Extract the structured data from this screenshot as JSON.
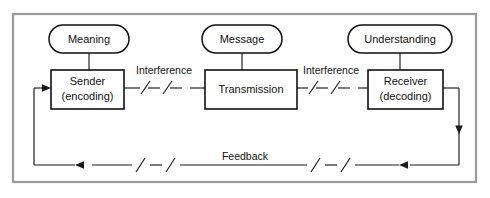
{
  "diagram": {
    "frame": {
      "border_color": "#9a9a9a",
      "background": "#ffffff"
    },
    "ink_color": "#111111",
    "stadium_nodes": [
      {
        "id": "meaning",
        "label": "Meaning",
        "cx": 89,
        "cy": 39,
        "w": 80,
        "h": 28
      },
      {
        "id": "message",
        "label": "Message",
        "cx": 242,
        "cy": 39,
        "w": 80,
        "h": 28
      },
      {
        "id": "understanding",
        "label": "Understanding",
        "cx": 400,
        "cy": 39,
        "w": 104,
        "h": 28
      }
    ],
    "box_nodes": [
      {
        "id": "sender",
        "line1": "Sender",
        "line2": "(encoding)",
        "x": 51,
        "y": 70,
        "w": 73,
        "h": 39
      },
      {
        "id": "transmission",
        "line1": "Transmission",
        "line2": "",
        "x": 205,
        "y": 70,
        "w": 92,
        "h": 39
      },
      {
        "id": "receiver",
        "line1": "Receiver",
        "line2": "(decoding)",
        "x": 368,
        "y": 70,
        "w": 75,
        "h": 39
      }
    ],
    "edge_labels": [
      {
        "id": "interference-left",
        "label": "Interference",
        "cx": 164,
        "cy": 71
      },
      {
        "id": "interference-right",
        "label": "Interference",
        "cx": 331,
        "cy": 71
      },
      {
        "id": "feedback",
        "label": "Feedback",
        "cx": 245,
        "cy": 157
      }
    ],
    "flow": {
      "forward_description": "Sender (encoding) to Transmission to Receiver (decoding)",
      "feedback_description": "Receiver (decoding) back to Sender (encoding)",
      "break_mark": "/ — /"
    }
  }
}
